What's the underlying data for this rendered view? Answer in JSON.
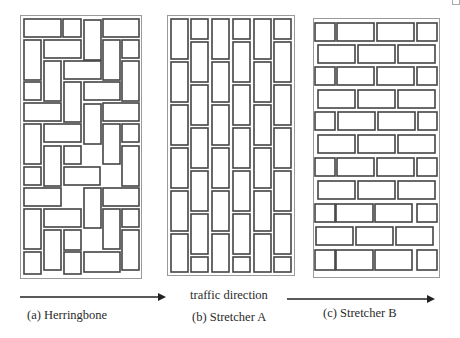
{
  "figure": {
    "panels": [
      {
        "id": "a",
        "label": "(a) Herringbone",
        "pattern": "herringbone"
      },
      {
        "id": "b",
        "label": "(b) Stretcher A",
        "pattern": "stretcher-vertical"
      },
      {
        "id": "c",
        "label": "(c) Stretcher B",
        "pattern": "stretcher-horizontal"
      }
    ],
    "traffic_label": "traffic direction"
  }
}
